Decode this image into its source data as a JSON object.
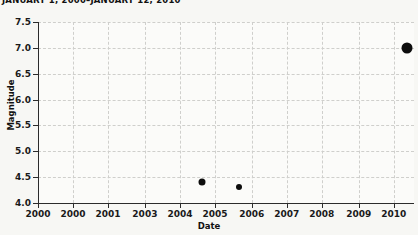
{
  "chart_data": {
    "type": "scatter",
    "title": "JANUARY 1, 2000–JANUARY 12, 2010",
    "xlabel": "Date",
    "ylabel": "Magnitude",
    "grid": true,
    "legend": null,
    "xlim": [
      2000,
      2010.2
    ],
    "ylim": [
      4.0,
      7.5
    ],
    "yticks": [
      4.0,
      4.5,
      5.0,
      5.5,
      6.0,
      6.5,
      7.0,
      7.5
    ],
    "ytick_labels": [
      "4.0",
      "4.5",
      "5.0",
      "5.5",
      "6.0",
      "6.5",
      "7.0",
      "7.5"
    ],
    "xticks": [
      2000.0,
      2000.95,
      2001.9,
      2002.9,
      2003.85,
      2004.8,
      2005.8,
      2006.75,
      2007.7,
      2008.7,
      2009.65
    ],
    "xtick_labels": [
      "2000",
      "2000",
      "2001",
      "2003",
      "2004",
      "2005",
      "2006",
      "2007",
      "2008",
      "2009",
      "2010"
    ],
    "points": [
      {
        "x": 2004.45,
        "y": 4.4,
        "size": 7
      },
      {
        "x": 2005.45,
        "y": 4.3,
        "size": 6
      },
      {
        "x": 2010.0,
        "y": 7.0,
        "size": 11
      }
    ],
    "marker_color": "#0d0d0d",
    "grid_color": "#cfcfcc",
    "axis_color": "#2b2b2b",
    "background_color": "#f7f7f4",
    "plot_background_color": "#fbfbf9"
  }
}
